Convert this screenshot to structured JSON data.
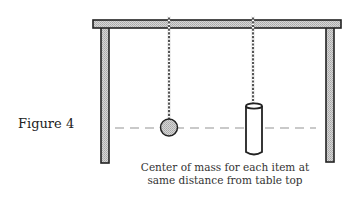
{
  "figure": {
    "label": "Figure 4",
    "caption_line1": "Center of mass for each item at",
    "caption_line2": "same distance from table top"
  },
  "diagram": {
    "elements": [
      {
        "name": "table-top",
        "shape": "rect"
      },
      {
        "name": "table-leg-left",
        "shape": "rect"
      },
      {
        "name": "table-leg-right",
        "shape": "rect"
      },
      {
        "name": "string-ball",
        "shape": "twisted-string"
      },
      {
        "name": "ball-pendulum",
        "shape": "circle"
      },
      {
        "name": "string-cylinder",
        "shape": "twisted-string"
      },
      {
        "name": "cylinder-pendulum",
        "shape": "cylinder"
      },
      {
        "name": "center-of-mass-line",
        "shape": "dashed-line"
      }
    ],
    "colors": {
      "outline": "#222222",
      "fill_hatched": "#c8c8c8",
      "dashed_line": "#b8b8b8",
      "cylinder_fill": "#ffffff"
    }
  }
}
